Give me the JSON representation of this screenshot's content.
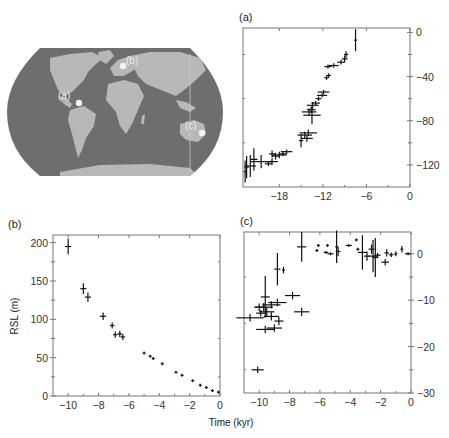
{
  "map": {
    "ocean_color": "#6e6e6e",
    "land_color": "#b8b8b8",
    "marker_color": "#f2f2f2",
    "sites": [
      {
        "label": "(a)",
        "x": 79,
        "y": 103,
        "lx": 58,
        "ly": 99
      },
      {
        "label": "(b)",
        "x": 123,
        "y": 66,
        "lx": 126,
        "ly": 64
      },
      {
        "label": "(c)",
        "x": 202,
        "y": 133,
        "lx": 185,
        "ly": 129
      }
    ]
  },
  "chart_data": [
    {
      "id": "a",
      "type": "scatter",
      "title": "(a)",
      "xlabel": "",
      "ylabel": "",
      "xlim": [
        -23,
        0
      ],
      "ylim": [
        -140,
        4
      ],
      "xticks": [
        -18,
        -12,
        -6,
        0
      ],
      "yticks": [
        0,
        -40,
        -80,
        -120
      ],
      "yaxis_side": "right",
      "grid": false,
      "points": [
        {
          "x": -7.5,
          "y": -7,
          "xerr": 0,
          "yerr": 10
        },
        {
          "x": -8.8,
          "y": -20,
          "xerr": 0.3,
          "yerr": 3
        },
        {
          "x": -9.0,
          "y": -24,
          "xerr": 0.4,
          "yerr": 3
        },
        {
          "x": -9.5,
          "y": -27,
          "xerr": 0.5,
          "yerr": 2
        },
        {
          "x": -10.5,
          "y": -30,
          "xerr": 0.7,
          "yerr": 2
        },
        {
          "x": -11.3,
          "y": -31,
          "xerr": 0.5,
          "yerr": 2
        },
        {
          "x": -11.5,
          "y": -41,
          "xerr": 0.3,
          "yerr": 2
        },
        {
          "x": -11.2,
          "y": -39,
          "xerr": 0.3,
          "yerr": 2
        },
        {
          "x": -11.9,
          "y": -54,
          "xerr": 0.8,
          "yerr": 2
        },
        {
          "x": -12.1,
          "y": -57,
          "xerr": 0.7,
          "yerr": 2
        },
        {
          "x": -12.6,
          "y": -60,
          "xerr": 0.4,
          "yerr": 2
        },
        {
          "x": -13.0,
          "y": -64,
          "xerr": 0.6,
          "yerr": 2
        },
        {
          "x": -13.4,
          "y": -66,
          "xerr": 0.8,
          "yerr": 3
        },
        {
          "x": -13.6,
          "y": -70,
          "xerr": 0.6,
          "yerr": 3
        },
        {
          "x": -13.9,
          "y": -72,
          "xerr": 1.0,
          "yerr": 3
        },
        {
          "x": -13.5,
          "y": -75,
          "xerr": 1.2,
          "yerr": 8
        },
        {
          "x": -14.0,
          "y": -91,
          "xerr": 1.2,
          "yerr": 3
        },
        {
          "x": -14.5,
          "y": -93,
          "xerr": 1.0,
          "yerr": 3
        },
        {
          "x": -14.2,
          "y": -96,
          "xerr": 0.8,
          "yerr": 3
        },
        {
          "x": -15.0,
          "y": -98,
          "xerr": 0.3,
          "yerr": 6
        },
        {
          "x": -17.0,
          "y": -108,
          "xerr": 0.8,
          "yerr": 2
        },
        {
          "x": -17.5,
          "y": -110,
          "xerr": 0.6,
          "yerr": 2
        },
        {
          "x": -18.0,
          "y": -111,
          "xerr": 1.0,
          "yerr": 3
        },
        {
          "x": -18.5,
          "y": -112,
          "xerr": 0.5,
          "yerr": 3
        },
        {
          "x": -19.0,
          "y": -110,
          "xerr": 0.4,
          "yerr": 3
        },
        {
          "x": -19.0,
          "y": -117,
          "xerr": 0.8,
          "yerr": 3
        },
        {
          "x": -19.5,
          "y": -119,
          "xerr": 0.5,
          "yerr": 2
        },
        {
          "x": -20.5,
          "y": -117,
          "xerr": 1.5,
          "yerr": 6
        },
        {
          "x": -21.5,
          "y": -115,
          "xerr": 0.5,
          "yerr": 10
        },
        {
          "x": -22.0,
          "y": -121,
          "xerr": 0.8,
          "yerr": 10
        },
        {
          "x": -22.5,
          "y": -122,
          "xerr": 0.3,
          "yerr": 10
        },
        {
          "x": -22.7,
          "y": -126,
          "xerr": 0.2,
          "yerr": 10
        }
      ]
    },
    {
      "id": "b",
      "type": "scatter",
      "title": "(b)",
      "xlabel": "Time (kyr)",
      "ylabel": "RSL (m)",
      "xlim": [
        -11,
        0
      ],
      "ylim": [
        0,
        210
      ],
      "xticks": [
        -10,
        -8,
        -6,
        -4,
        -2,
        0
      ],
      "yticks": [
        0,
        50,
        100,
        150,
        200
      ],
      "yaxis_side": "left",
      "grid": false,
      "points": [
        {
          "x": -10.0,
          "y": 195,
          "xerr": 0.2,
          "yerr": 10
        },
        {
          "x": -9.0,
          "y": 140,
          "xerr": 0.2,
          "yerr": 7
        },
        {
          "x": -8.7,
          "y": 129,
          "xerr": 0.2,
          "yerr": 6
        },
        {
          "x": -7.7,
          "y": 104,
          "xerr": 0.2,
          "yerr": 5
        },
        {
          "x": -7.1,
          "y": 92,
          "xerr": 0.15,
          "yerr": 4
        },
        {
          "x": -6.9,
          "y": 80,
          "xerr": 0.15,
          "yerr": 4
        },
        {
          "x": -6.6,
          "y": 81,
          "xerr": 0.15,
          "yerr": 4
        },
        {
          "x": -6.4,
          "y": 77,
          "xerr": 0.15,
          "yerr": 4
        },
        {
          "x": -5.0,
          "y": 56,
          "xerr": 0.1,
          "yerr": 1
        },
        {
          "x": -4.6,
          "y": 52,
          "xerr": 0.1,
          "yerr": 1
        },
        {
          "x": -4.4,
          "y": 49,
          "xerr": 0.1,
          "yerr": 1
        },
        {
          "x": -3.8,
          "y": 42,
          "xerr": 0.1,
          "yerr": 1
        },
        {
          "x": -2.9,
          "y": 31,
          "xerr": 0.1,
          "yerr": 1
        },
        {
          "x": -2.5,
          "y": 27,
          "xerr": 0.1,
          "yerr": 1
        },
        {
          "x": -1.8,
          "y": 20,
          "xerr": 0.08,
          "yerr": 1
        },
        {
          "x": -1.3,
          "y": 14,
          "xerr": 0.08,
          "yerr": 0
        },
        {
          "x": -0.9,
          "y": 11,
          "xerr": 0.08,
          "yerr": 0
        },
        {
          "x": -0.5,
          "y": 7,
          "xerr": 0.08,
          "yerr": 0
        },
        {
          "x": -0.1,
          "y": 5,
          "xerr": 0.08,
          "yerr": 1
        }
      ]
    },
    {
      "id": "c",
      "type": "scatter",
      "title": "(c)",
      "xlabel": "Time (kyr)",
      "ylabel": "",
      "xlim": [
        -11,
        0
      ],
      "ylim": [
        -30,
        4.7
      ],
      "xticks": [
        -10,
        -8,
        -6,
        -4,
        -2,
        0
      ],
      "yticks": [
        0,
        -10,
        -20,
        -30
      ],
      "yaxis_side": "right",
      "grid": false,
      "points": [
        {
          "x": -7.2,
          "y": 1.5,
          "xerr": 0.3,
          "yerr": 3.2
        },
        {
          "x": -8.8,
          "y": -3.3,
          "xerr": 0.2,
          "yerr": 3.5
        },
        {
          "x": -8.4,
          "y": -3.5,
          "xerr": 0.1,
          "yerr": 0.7
        },
        {
          "x": -9.6,
          "y": -9.3,
          "xerr": 0.3,
          "yerr": 4.5
        },
        {
          "x": -7.8,
          "y": -9.0,
          "xerr": 0.5,
          "yerr": 0.8
        },
        {
          "x": -10.0,
          "y": -11.5,
          "xerr": 0.3,
          "yerr": 0.8
        },
        {
          "x": -9.7,
          "y": -11.5,
          "xerr": 0.6,
          "yerr": 0.9
        },
        {
          "x": -9.2,
          "y": -11.0,
          "xerr": 0.6,
          "yerr": 0.8
        },
        {
          "x": -8.8,
          "y": -10.5,
          "xerr": 0.6,
          "yerr": 0.8
        },
        {
          "x": -9.9,
          "y": -12.8,
          "xerr": 0.3,
          "yerr": 0.7
        },
        {
          "x": -9.5,
          "y": -12.5,
          "xerr": 0.5,
          "yerr": 1.0
        },
        {
          "x": -10.6,
          "y": -13.8,
          "xerr": 0.9,
          "yerr": 0.8
        },
        {
          "x": -9.2,
          "y": -13.5,
          "xerr": 0.5,
          "yerr": 0.9
        },
        {
          "x": -8.7,
          "y": -14.5,
          "xerr": 0.3,
          "yerr": 0.9
        },
        {
          "x": -7.2,
          "y": -12.5,
          "xerr": 0.5,
          "yerr": 0.9
        },
        {
          "x": -9.6,
          "y": -16.3,
          "xerr": 0.6,
          "yerr": 0.8
        },
        {
          "x": -9.0,
          "y": -16.0,
          "xerr": 0.5,
          "yerr": 0.8
        },
        {
          "x": -10.1,
          "y": -25.0,
          "xerr": 0.4,
          "yerr": 0.7
        },
        {
          "x": -6.1,
          "y": 1.8,
          "xerr": 0.1,
          "yerr": 0.3
        },
        {
          "x": -6.2,
          "y": 0.7,
          "xerr": 0.1,
          "yerr": 0.3
        },
        {
          "x": -5.6,
          "y": 0.3,
          "xerr": 0.15,
          "yerr": 0.3
        },
        {
          "x": -5.3,
          "y": 0,
          "xerr": 0.2,
          "yerr": 0.3
        },
        {
          "x": -5.5,
          "y": 1.8,
          "xerr": 0.1,
          "yerr": 0.3
        },
        {
          "x": -4.9,
          "y": 1.5,
          "xerr": 0.1,
          "yerr": 3.5
        },
        {
          "x": -4.8,
          "y": 0.5,
          "xerr": 0.15,
          "yerr": 1.0
        },
        {
          "x": -4.1,
          "y": 1.8,
          "xerr": 0.2,
          "yerr": 0.3
        },
        {
          "x": -3.6,
          "y": 3.0,
          "xerr": 0.1,
          "yerr": 0.3
        },
        {
          "x": -3.5,
          "y": 1.0,
          "xerr": 0.1,
          "yerr": 0.3
        },
        {
          "x": -3.2,
          "y": 0.3,
          "xerr": 0.3,
          "yerr": 3.7
        },
        {
          "x": -2.9,
          "y": -0.5,
          "xerr": 0.2,
          "yerr": 1.0
        },
        {
          "x": -2.6,
          "y": 1.0,
          "xerr": 0.2,
          "yerr": 1.0
        },
        {
          "x": -2.5,
          "y": -0.5,
          "xerr": 0.3,
          "yerr": 3.5
        },
        {
          "x": -2.35,
          "y": -0.8,
          "xerr": 0.2,
          "yerr": 4.2
        },
        {
          "x": -2.2,
          "y": -0.3,
          "xerr": 0.2,
          "yerr": 0.5
        },
        {
          "x": -1.7,
          "y": -1.8,
          "xerr": 0.25,
          "yerr": 0.7
        },
        {
          "x": -1.6,
          "y": 0.2,
          "xerr": 0.15,
          "yerr": 0.8
        },
        {
          "x": -1.3,
          "y": -0.2,
          "xerr": 0.15,
          "yerr": 0.5
        },
        {
          "x": -1.0,
          "y": 0,
          "xerr": 0.1,
          "yerr": 0.5
        },
        {
          "x": -0.6,
          "y": 1.0,
          "xerr": 0.1,
          "yerr": 0.7
        },
        {
          "x": -0.2,
          "y": 0,
          "xerr": 0.2,
          "yerr": 0.3
        }
      ]
    }
  ],
  "panels": {
    "a": {
      "left": 243,
      "top": 28,
      "right": 410,
      "bottom": 187
    },
    "b": {
      "left": 53,
      "top": 235,
      "right": 220,
      "bottom": 396
    },
    "c": {
      "left": 244,
      "top": 232,
      "right": 411,
      "bottom": 393
    }
  }
}
